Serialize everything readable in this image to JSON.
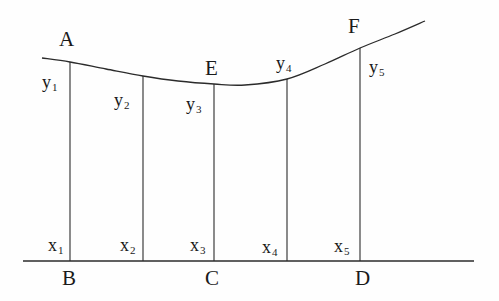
{
  "figure": {
    "type": "geometry-diagram",
    "stroke_color": "#2b2b2b",
    "text_color": "#1a1a1a",
    "background_color": "#fefefe",
    "curve_points": [
      {
        "x": 42,
        "y": 58
      },
      {
        "x": 70,
        "y": 62
      },
      {
        "x": 106,
        "y": 69
      },
      {
        "x": 143,
        "y": 76
      },
      {
        "x": 178,
        "y": 81
      },
      {
        "x": 214,
        "y": 84
      },
      {
        "x": 245,
        "y": 85
      },
      {
        "x": 287,
        "y": 79
      },
      {
        "x": 325,
        "y": 64
      },
      {
        "x": 360,
        "y": 48
      },
      {
        "x": 395,
        "y": 34
      },
      {
        "x": 425,
        "y": 21
      }
    ],
    "baseline": {
      "x1": 23,
      "y1": 261,
      "x2": 474,
      "y2": 261
    },
    "ordinates": [
      {
        "name": "y1",
        "x": 70,
        "y_top": 62,
        "y_bottom": 261
      },
      {
        "name": "y2",
        "x": 143,
        "y_top": 76,
        "y_bottom": 261
      },
      {
        "name": "y3",
        "x": 214,
        "y_top": 84,
        "y_bottom": 261
      },
      {
        "name": "y4",
        "x": 287,
        "y_top": 79,
        "y_bottom": 261
      },
      {
        "name": "y5",
        "x": 360,
        "y_top": 48,
        "y_bottom": 261
      }
    ]
  },
  "labels": {
    "curve_points": [
      {
        "id": "point-a",
        "text": "A",
        "x": 59,
        "y": 29
      },
      {
        "id": "point-e",
        "text": "E",
        "x": 205,
        "y": 58
      },
      {
        "id": "point-f",
        "text": "F",
        "x": 348,
        "y": 16
      }
    ],
    "ordinate_labels": [
      {
        "id": "ordinate-label-y1",
        "base": "y",
        "sub": "1",
        "x": 42,
        "y": 73
      },
      {
        "id": "ordinate-label-y2",
        "base": "y",
        "sub": "2",
        "x": 114,
        "y": 91
      },
      {
        "id": "ordinate-label-y3",
        "base": "y",
        "sub": "3",
        "x": 186,
        "y": 95
      },
      {
        "id": "ordinate-label-y4",
        "base": "y",
        "sub": "4",
        "x": 276,
        "y": 54
      },
      {
        "id": "ordinate-label-y5",
        "base": "y",
        "sub": "5",
        "x": 369,
        "y": 58
      }
    ],
    "abscissa_labels": [
      {
        "id": "abscissa-label-x1",
        "base": "x",
        "sub": "1",
        "x": 48,
        "y": 236
      },
      {
        "id": "abscissa-label-x2",
        "base": "x",
        "sub": "2",
        "x": 120,
        "y": 236
      },
      {
        "id": "abscissa-label-x3",
        "base": "x",
        "sub": "3",
        "x": 190,
        "y": 236
      },
      {
        "id": "abscissa-label-x4",
        "base": "x",
        "sub": "4",
        "x": 262,
        "y": 238
      },
      {
        "id": "abscissa-label-x5",
        "base": "x",
        "sub": "5",
        "x": 334,
        "y": 237
      }
    ],
    "baseline_points": [
      {
        "id": "point-b",
        "text": "B",
        "x": 62,
        "y": 268
      },
      {
        "id": "point-c",
        "text": "C",
        "x": 205,
        "y": 268
      },
      {
        "id": "point-d",
        "text": "D",
        "x": 355,
        "y": 268
      }
    ]
  }
}
